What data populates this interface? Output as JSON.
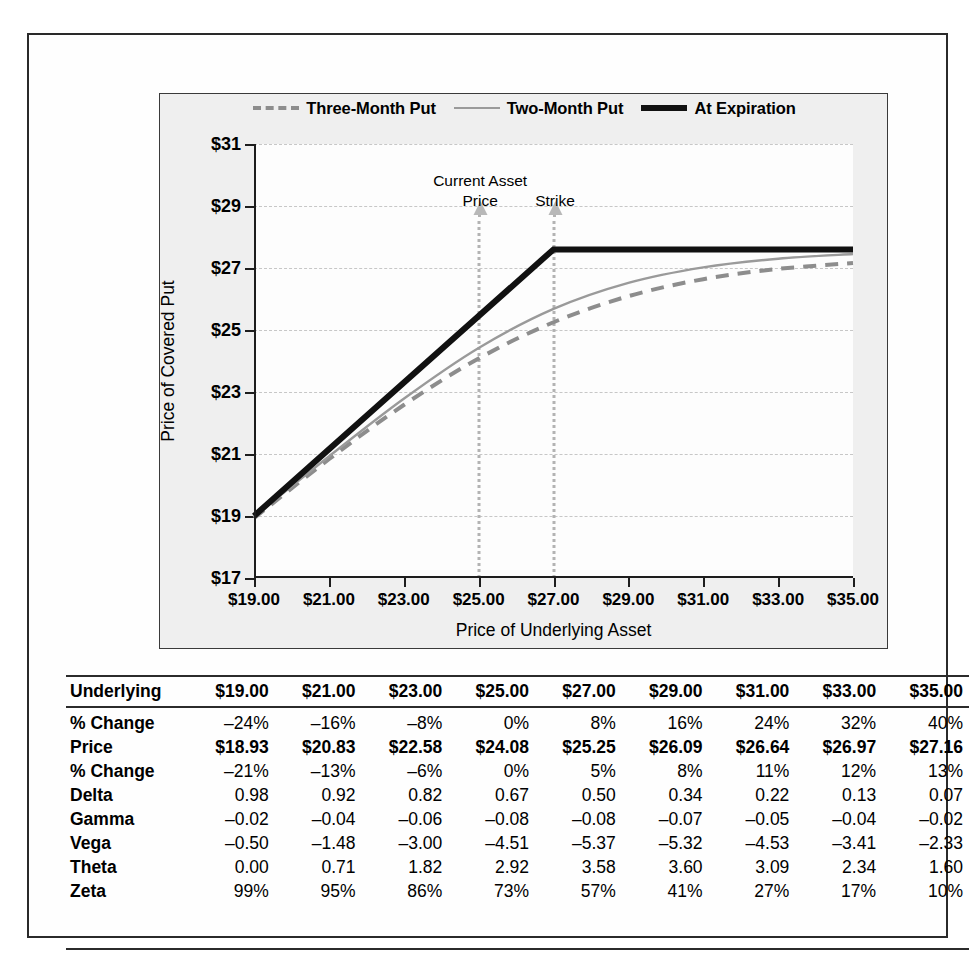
{
  "chart_data": {
    "type": "line",
    "title": "",
    "xlabel": "Price of Underlying Asset",
    "ylabel": "Price of Covered Put",
    "xlim": [
      19,
      35
    ],
    "ylim": [
      17,
      31
    ],
    "xticks": [
      "$19.00",
      "$21.00",
      "$23.00",
      "$25.00",
      "$27.00",
      "$29.00",
      "$31.00",
      "$33.00",
      "$35.00"
    ],
    "xtick_values": [
      19,
      21,
      23,
      25,
      27,
      29,
      31,
      33,
      35
    ],
    "yticks": [
      "$17",
      "$19",
      "$21",
      "$23",
      "$25",
      "$27",
      "$29",
      "$31"
    ],
    "ytick_values": [
      17,
      19,
      21,
      23,
      25,
      27,
      29,
      31
    ],
    "grid": true,
    "legend_position": "top-center",
    "x": [
      19,
      21,
      23,
      25,
      27,
      29,
      31,
      33,
      35
    ],
    "series": [
      {
        "name": "Three-Month Put",
        "style": "dashed",
        "color": "#8d8d8d",
        "values": [
          18.93,
          20.83,
          22.58,
          24.08,
          25.25,
          26.09,
          26.64,
          26.97,
          27.16
        ]
      },
      {
        "name": "Two-Month Put",
        "style": "solid-thin",
        "color": "#9a9a9a",
        "values": [
          18.98,
          20.92,
          22.78,
          24.42,
          25.68,
          26.52,
          27.02,
          27.3,
          27.45
        ]
      },
      {
        "name": "At Expiration",
        "style": "solid-thick",
        "color": "#111111",
        "values": [
          19.0,
          21.0,
          23.0,
          25.0,
          27.6,
          27.6,
          27.6,
          27.6,
          27.6
        ]
      }
    ],
    "annotations": [
      {
        "name": "current-asset-price",
        "lines": [
          "Current Asset",
          "Price"
        ],
        "x_value": 25
      },
      {
        "name": "strike",
        "lines": [
          "Strike"
        ],
        "x_value": 27
      }
    ]
  },
  "legend": {
    "items": [
      {
        "label": "Three-Month Put",
        "swatch": "dashed-line-icon"
      },
      {
        "label": "Two-Month Put",
        "swatch": "thin-line-icon"
      },
      {
        "label": "At Expiration",
        "swatch": "thick-line-icon"
      }
    ]
  },
  "table": {
    "header": {
      "row_label": "Underlying",
      "columns": [
        "$19.00",
        "$21.00",
        "$23.00",
        "$25.00",
        "$27.00",
        "$29.00",
        "$31.00",
        "$33.00",
        "$35.00"
      ]
    },
    "rows": [
      {
        "label": "% Change",
        "bold": false,
        "values": [
          "–24%",
          "–16%",
          "–8%",
          "0%",
          "8%",
          "16%",
          "24%",
          "32%",
          "40%"
        ]
      },
      {
        "label": "Price",
        "bold": true,
        "values": [
          "$18.93",
          "$20.83",
          "$22.58",
          "$24.08",
          "$25.25",
          "$26.09",
          "$26.64",
          "$26.97",
          "$27.16"
        ]
      },
      {
        "label": "% Change",
        "bold": false,
        "values": [
          "–21%",
          "–13%",
          "–6%",
          "0%",
          "5%",
          "8%",
          "11%",
          "12%",
          "13%"
        ]
      },
      {
        "label": "Delta",
        "bold": false,
        "values": [
          "0.98",
          "0.92",
          "0.82",
          "0.67",
          "0.50",
          "0.34",
          "0.22",
          "0.13",
          "0.07"
        ]
      },
      {
        "label": "Gamma",
        "bold": false,
        "values": [
          "–0.02",
          "–0.04",
          "–0.06",
          "–0.08",
          "–0.08",
          "–0.07",
          "–0.05",
          "–0.04",
          "–0.02"
        ]
      },
      {
        "label": "Vega",
        "bold": false,
        "values": [
          "–0.50",
          "–1.48",
          "–3.00",
          "–4.51",
          "–5.37",
          "–5.32",
          "–4.53",
          "–3.41",
          "–2.33"
        ]
      },
      {
        "label": "Theta",
        "bold": false,
        "values": [
          "0.00",
          "0.71",
          "1.82",
          "2.92",
          "3.58",
          "3.60",
          "3.09",
          "2.34",
          "1.60"
        ]
      },
      {
        "label": "Zeta",
        "bold": false,
        "values": [
          "99%",
          "95%",
          "86%",
          "73%",
          "57%",
          "41%",
          "27%",
          "17%",
          "10%"
        ]
      }
    ]
  }
}
